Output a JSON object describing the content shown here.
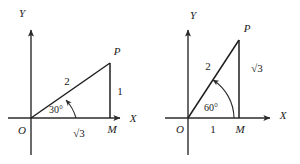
{
  "figure": {
    "background_color": "#ffffff",
    "ink_color": "#1f1f1f",
    "panels": [
      {
        "id": "left-panel",
        "name": "triangle-30-degrees",
        "axis_x_label": "X",
        "axis_y_label": "Y",
        "origin_label": "O",
        "vertex_p_label": "P",
        "foot_label": "M",
        "hypotenuse_label": "2",
        "base_label": "√3",
        "height_label": "1",
        "angle_label": "30°",
        "geometry": {
          "origin": [
            31,
            118
          ],
          "point_p": [
            110,
            63
          ],
          "point_m": [
            110,
            118
          ],
          "x_axis": [
            8,
            118,
            126,
            118
          ],
          "y_axis": [
            31,
            155,
            31,
            25
          ]
        }
      },
      {
        "id": "right-panel",
        "name": "triangle-60-degrees",
        "axis_x_label": "X",
        "axis_y_label": "Y",
        "origin_label": "O",
        "vertex_p_label": "P",
        "foot_label": "M",
        "hypotenuse_label": "2",
        "base_label": "1",
        "height_label": "√3",
        "angle_label": "60°",
        "geometry": {
          "origin": [
            188,
            118
          ],
          "point_p": [
            237,
            40
          ],
          "point_m": [
            237,
            118
          ],
          "x_axis": [
            165,
            118,
            275,
            118
          ],
          "y_axis": [
            188,
            155,
            188,
            25
          ]
        }
      }
    ]
  }
}
